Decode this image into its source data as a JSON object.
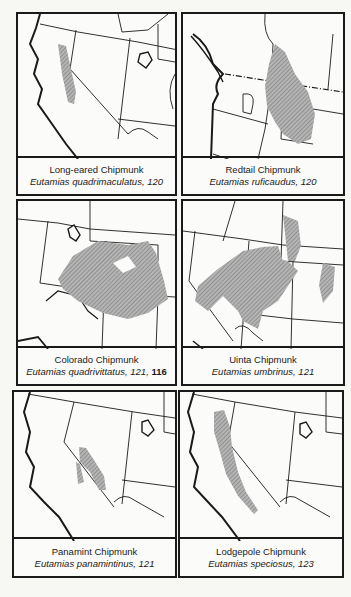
{
  "colors": {
    "ink": "#1a1a1a",
    "range": "#9a9a9a",
    "paper": "#fbfbf9"
  },
  "panels": [
    {
      "common_name": "Long-eared Chipmunk",
      "scientific_name": "Eutamias quadrimaculatus",
      "pages": ", 120",
      "bold_page": ""
    },
    {
      "common_name": "Redtail Chipmunk",
      "scientific_name": "Eutamias ruficaudus",
      "pages": ", 120",
      "bold_page": ""
    },
    {
      "common_name": "Colorado Chipmunk",
      "scientific_name": "Eutamias quadrivittatus",
      "pages": ", 121, ",
      "bold_page": "116"
    },
    {
      "common_name": "Uinta Chipmunk",
      "scientific_name": "Eutamias umbrinus",
      "pages": ", 121",
      "bold_page": ""
    },
    {
      "common_name": "Panamint Chipmunk",
      "scientific_name": "Eutamias panamintinus",
      "pages": ", 121",
      "bold_page": ""
    },
    {
      "common_name": "Lodgepole Chipmunk",
      "scientific_name": "Eutamias speciosus",
      "pages": ", 123",
      "bold_page": ""
    }
  ]
}
